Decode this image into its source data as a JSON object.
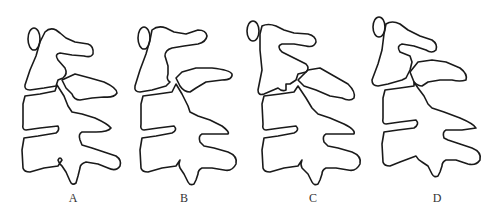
{
  "figure": {
    "panels": [
      {
        "label": "A",
        "description": "Lumbar vertebral segment outline, normal facet alignment"
      },
      {
        "label": "B",
        "description": "Lumbar vertebral segment outline, facet gap variant"
      },
      {
        "label": "C",
        "description": "Lumbar vertebral segment outline, interlocked facet variant"
      },
      {
        "label": "D",
        "description": "Lumbar vertebral segment outline, displaced facet variant"
      }
    ],
    "colors": {
      "stroke": "#1a1a1a",
      "background": "#ffffff",
      "label": "#333333"
    }
  }
}
